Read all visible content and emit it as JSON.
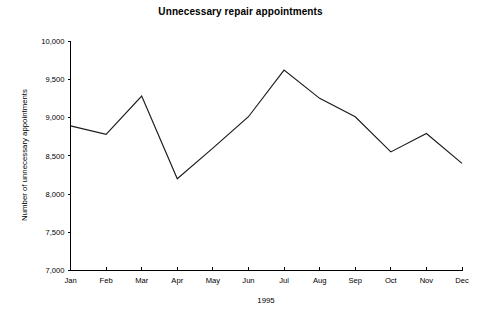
{
  "chart_data": {
    "type": "line",
    "title": "Unnecessary repair appointments",
    "xlabel": "1995",
    "ylabel": "Number of unnecessary appointments",
    "categories": [
      "Jan",
      "Feb",
      "Mar",
      "Apr",
      "May",
      "Jun",
      "Jul",
      "Aug",
      "Sep",
      "Oct",
      "Nov",
      "Dec"
    ],
    "values": [
      8890,
      8780,
      9280,
      8200,
      8600,
      9010,
      9620,
      9250,
      9010,
      8550,
      8790,
      8400
    ],
    "ylim": [
      7000,
      10000
    ],
    "ytick_values": [
      7000,
      7500,
      8000,
      8500,
      9000,
      9500,
      10000
    ],
    "ytick_labels": [
      "7,000",
      "7,500",
      "8,000",
      "8,500",
      "9,000",
      "9,500",
      "10,000"
    ],
    "grid": false,
    "legend": false,
    "legend_position": "none",
    "line_color": "#1a1a1a",
    "background_color": "#ffffff"
  }
}
